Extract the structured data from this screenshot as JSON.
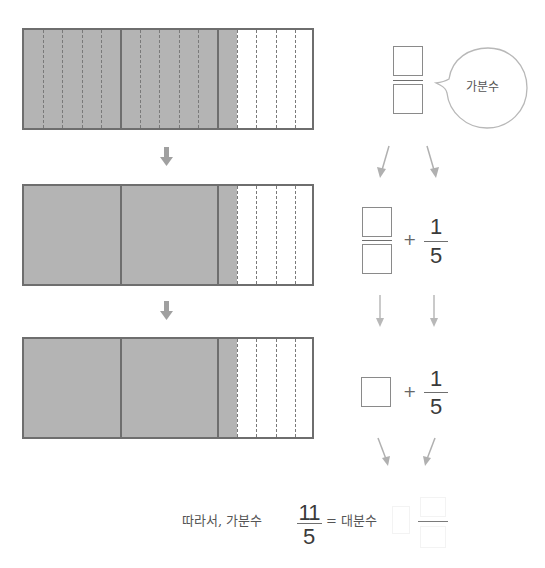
{
  "diagram": {
    "bars": [
      {
        "id": "bar-1",
        "units": 3,
        "parts_per_unit": 5,
        "shaded_parts": 11,
        "show_inner_dashes_shaded": true
      },
      {
        "id": "bar-2",
        "units": 3,
        "parts_per_unit": 5,
        "shaded_parts": 11,
        "show_inner_dashes_shaded": false
      },
      {
        "id": "bar-3",
        "units": 3,
        "parts_per_unit": 5,
        "shaded_parts": 11,
        "show_inner_dashes_shaded": false
      }
    ],
    "bubble_label": "가분수",
    "step2": {
      "plus": "+",
      "numerator": "1",
      "denominator": "5"
    },
    "step3": {
      "plus": "+",
      "numerator": "1",
      "denominator": "5"
    },
    "conclusion": {
      "prefix": "따라서, 가분수",
      "numerator": "11",
      "denominator": "5",
      "equals_text": "= 대분수"
    },
    "colors": {
      "shade": "#b4b4b4",
      "border": "#6e6e6e",
      "arrow": "#a8a8a8"
    }
  }
}
